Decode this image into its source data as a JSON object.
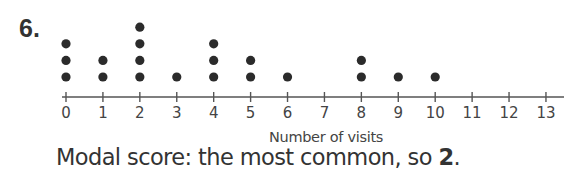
{
  "question": {
    "number": "6."
  },
  "answer": {
    "prefix": "Modal score: the most common, so ",
    "value": "2",
    "suffix": "."
  },
  "colors": {
    "dot": "#2b2b2b",
    "axis": "#555555",
    "text": "#333333"
  },
  "chart_data": {
    "type": "dot",
    "title": "",
    "xlabel": "Number of visits",
    "ylabel": "",
    "categories": [
      0,
      1,
      2,
      3,
      4,
      5,
      6,
      7,
      8,
      9,
      10,
      11,
      12,
      13
    ],
    "values": [
      3,
      2,
      4,
      1,
      3,
      2,
      1,
      0,
      2,
      1,
      1,
      0,
      0,
      0
    ],
    "xlim": [
      0,
      13
    ],
    "x_ticks": [
      "0",
      "1",
      "2",
      "3",
      "4",
      "5",
      "6",
      "7",
      "8",
      "9",
      "10",
      "11",
      "12",
      "13"
    ],
    "grid": false,
    "legend": null,
    "mode": 2
  }
}
